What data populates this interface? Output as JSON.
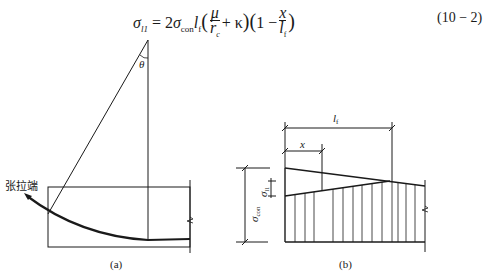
{
  "formula": {
    "lhs": "σ",
    "lhs_sub": "l1",
    "equals": " = 2",
    "sigma": "σ",
    "sigma_sub": "con",
    "lf": "l",
    "lf_sub": "f",
    "frac1_num": "μ",
    "frac1_den": "r",
    "frac1_den_sub": "c",
    "plus_kappa": "+ κ",
    "one_minus": "1 −",
    "frac2_num": "x",
    "frac2_den": "l",
    "frac2_den_sub": "f",
    "equation_number": "(10 − 2)"
  },
  "diagram_a": {
    "angle_label": "θ",
    "tension_end_label": "张拉端",
    "caption": "(a)"
  },
  "diagram_b": {
    "lf_label": "l",
    "lf_sub": "f",
    "x_label": "x",
    "sigma_con_label": "σ",
    "sigma_con_sub": "con",
    "sigma_l1_label": "σ",
    "sigma_l1_sub": "l1",
    "caption": "(b)"
  }
}
